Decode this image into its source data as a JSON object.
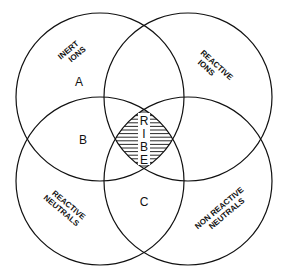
{
  "diagram": {
    "type": "venn",
    "sets": [
      {
        "id": "inert-ions",
        "label_lines": [
          "INERT",
          "IONS"
        ]
      },
      {
        "id": "reactive-ions",
        "label_lines": [
          "REACTIVE",
          "IONS"
        ]
      },
      {
        "id": "reactive-neutrals",
        "label_lines": [
          "REACTIVE",
          "NEUTRALS"
        ]
      },
      {
        "id": "non-reactive-neutrals",
        "label_lines": [
          "NON REACTIVE",
          "NEUTRALS"
        ]
      }
    ],
    "regions": {
      "a": "A",
      "b": "B",
      "c": "C"
    },
    "center_label": [
      "R",
      "I",
      "B",
      "E"
    ],
    "colors": {
      "stroke": "#111111",
      "background": "#ffffff"
    }
  }
}
